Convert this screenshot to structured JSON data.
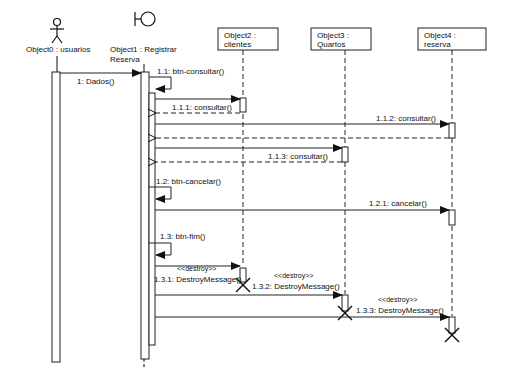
{
  "diagram": {
    "type": "UML sequence diagram",
    "colors": {
      "line": "#222222",
      "background": "#ffffff",
      "box_fill": "#ffffff"
    },
    "lifelines": [
      {
        "id": "obj0",
        "kind": "actor",
        "icon": "actor-stick-figure-icon",
        "label_line1": "Object0 : usuarios",
        "label_line2": ""
      },
      {
        "id": "obj1",
        "kind": "boundary",
        "icon": "boundary-icon",
        "label_line1": "Object1 : Registrar",
        "label_line2": "Reserva"
      },
      {
        "id": "obj2",
        "kind": "object",
        "label_line1": "Object2 :",
        "label_line2": "clientes"
      },
      {
        "id": "obj3",
        "kind": "object",
        "label_line1": "Object3 :",
        "label_line2": "Quartos"
      },
      {
        "id": "obj4",
        "kind": "object",
        "label_line1": "Object4 :",
        "label_line2": "reserva"
      }
    ],
    "messages": [
      {
        "seq": "1",
        "label": "1: Dados()",
        "from": "obj0",
        "to": "obj1",
        "type": "sync"
      },
      {
        "seq": "1.1",
        "label": "1.1: btn-consultar()",
        "from": "obj1",
        "to": "obj1",
        "type": "self"
      },
      {
        "seq": "1.1.1",
        "label": "1.1.1: consultar()",
        "from": "obj1",
        "to": "obj2",
        "type": "sync"
      },
      {
        "seq": "1.1.1r",
        "label": "",
        "from": "obj2",
        "to": "obj1",
        "type": "return"
      },
      {
        "seq": "1.1.2",
        "label": "1.1.2: consultar()",
        "from": "obj1",
        "to": "obj4",
        "type": "sync"
      },
      {
        "seq": "1.1.2r",
        "label": "",
        "from": "obj4",
        "to": "obj1",
        "type": "return"
      },
      {
        "seq": "1.1.3",
        "label": "1.1.3: consultar()",
        "from": "obj1",
        "to": "obj3",
        "type": "sync"
      },
      {
        "seq": "1.1.3r",
        "label": "",
        "from": "obj3",
        "to": "obj1",
        "type": "return"
      },
      {
        "seq": "1.2",
        "label": "1.2: btn-cancelar()",
        "from": "obj1",
        "to": "obj1",
        "type": "self"
      },
      {
        "seq": "1.2.1",
        "label": "1.2.1: cancelar()",
        "from": "obj1",
        "to": "obj4",
        "type": "sync"
      },
      {
        "seq": "1.3",
        "label": "1.3: btn-fim()",
        "from": "obj1",
        "to": "obj1",
        "type": "self"
      },
      {
        "seq": "1.3.1",
        "label": "1.3.1: DestroyMessage()",
        "stereotype": "<<destroy>>",
        "from": "obj1",
        "to": "obj2",
        "type": "destroy"
      },
      {
        "seq": "1.3.2",
        "label": "1.3.2: DestroyMessage()",
        "stereotype": "<<destroy>>",
        "from": "obj1",
        "to": "obj3",
        "type": "destroy"
      },
      {
        "seq": "1.3.3",
        "label": "1.3.3: DestroyMessage()",
        "stereotype": "<<destroy>>",
        "from": "obj1",
        "to": "obj4",
        "type": "destroy"
      }
    ]
  }
}
